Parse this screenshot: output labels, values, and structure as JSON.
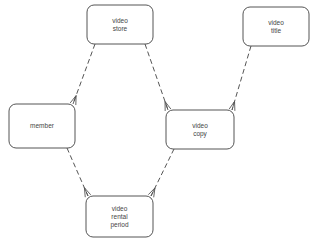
{
  "diagram": {
    "type": "entity-relationship",
    "notation": "crow's foot, dashed relationship lines",
    "colors": {
      "stroke": "#555555",
      "text": "#444444",
      "background": "#ffffff"
    },
    "entities": [
      {
        "id": "video_store",
        "lines": [
          "video",
          "store"
        ],
        "x": 87,
        "y": 5,
        "w": 66,
        "h": 39
      },
      {
        "id": "video_title",
        "lines": [
          "video",
          "title"
        ],
        "x": 243,
        "y": 7,
        "w": 66,
        "h": 39
      },
      {
        "id": "member",
        "lines": [
          "member"
        ],
        "x": 9,
        "y": 104,
        "w": 66,
        "h": 44
      },
      {
        "id": "video_copy",
        "lines": [
          "video",
          "copy"
        ],
        "x": 166,
        "y": 110,
        "w": 68,
        "h": 39
      },
      {
        "id": "video_rental_period",
        "lines": [
          "video",
          "rental",
          "period"
        ],
        "x": 86,
        "y": 196,
        "w": 67,
        "h": 41
      }
    ],
    "relationships": [
      {
        "from": "video_store",
        "to": "member",
        "many_end": "member"
      },
      {
        "from": "video_store",
        "to": "video_copy",
        "many_end": "video_copy"
      },
      {
        "from": "video_title",
        "to": "video_copy",
        "many_end": "video_copy"
      },
      {
        "from": "member",
        "to": "video_rental_period",
        "many_end": "video_rental_period"
      },
      {
        "from": "video_copy",
        "to": "video_rental_period",
        "many_end": "video_rental_period"
      }
    ]
  }
}
